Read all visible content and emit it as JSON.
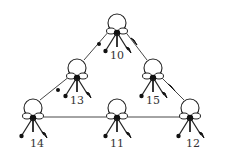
{
  "diagram": {
    "type": "triangular-network",
    "stroke_color": "#222222",
    "background": "#ffffff",
    "nodes": [
      {
        "id": "10",
        "label": "10",
        "x": 117,
        "y": 23
      },
      {
        "id": "13",
        "label": "13",
        "x": 77,
        "y": 68
      },
      {
        "id": "15",
        "label": "15",
        "x": 153,
        "y": 68
      },
      {
        "id": "14",
        "label": "14",
        "x": 33,
        "y": 108
      },
      {
        "id": "11",
        "label": "11",
        "x": 117,
        "y": 108
      },
      {
        "id": "12",
        "label": "12",
        "x": 190,
        "y": 108
      }
    ],
    "edges": [
      {
        "from": "10",
        "to": "13",
        "marker": "dot"
      },
      {
        "from": "10",
        "to": "15",
        "marker": "arrow"
      },
      {
        "from": "13",
        "to": "14",
        "marker": "dot"
      },
      {
        "from": "15",
        "to": "12",
        "marker": "arrow"
      },
      {
        "from": "14",
        "to": "11",
        "marker": "none"
      },
      {
        "from": "11",
        "to": "12",
        "marker": "none"
      }
    ],
    "node_glyph": "ring-with-three-pendant-keys"
  }
}
